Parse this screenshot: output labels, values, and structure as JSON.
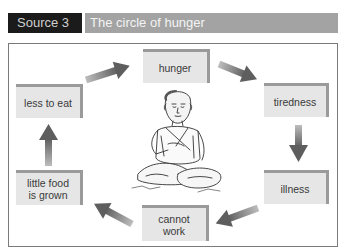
{
  "header": {
    "source_label": "Source 3",
    "title": "The circle of hunger"
  },
  "diagram": {
    "nodes": [
      {
        "id": "hunger",
        "label": "hunger"
      },
      {
        "id": "tiredness",
        "label": "tiredness"
      },
      {
        "id": "illness",
        "label": "illness"
      },
      {
        "id": "cannot-work",
        "label": "cannot work",
        "line1": "cannot",
        "line2": "work"
      },
      {
        "id": "little-food",
        "label": "little food is grown",
        "line1": "little food",
        "line2": "is grown"
      },
      {
        "id": "less-to-eat",
        "label": "less to eat"
      }
    ],
    "edges": [
      [
        "hunger",
        "tiredness"
      ],
      [
        "tiredness",
        "illness"
      ],
      [
        "illness",
        "cannot-work"
      ],
      [
        "cannot-work",
        "little-food"
      ],
      [
        "little-food",
        "less-to-eat"
      ],
      [
        "less-to-eat",
        "hunger"
      ]
    ],
    "illustration": "starving-child-sketch",
    "colors": {
      "box_fill": "#e6e6e6",
      "box_edge": "#9a9a9a",
      "arrow": "#6e6e6e",
      "label_bg": "#1b1b1b",
      "title_bg": "#a3a3a3"
    }
  }
}
